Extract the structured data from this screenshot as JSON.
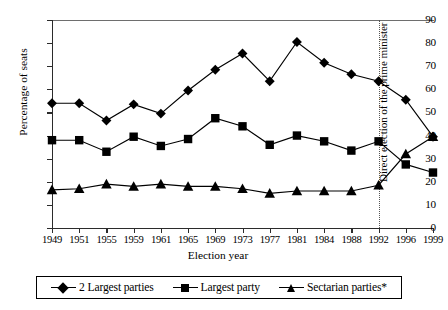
{
  "chart_data": {
    "type": "line",
    "title": "",
    "xlabel": "Election year",
    "ylabel": "Percentage of seats",
    "ylim": [
      0,
      90
    ],
    "yticks": [
      0,
      10,
      20,
      30,
      40,
      50,
      60,
      70,
      80,
      90
    ],
    "grid": false,
    "legend_position": "bottom",
    "categories": [
      "1949",
      "1951",
      "1955",
      "1959",
      "1961",
      "1965",
      "1969",
      "1973",
      "1977",
      "1981",
      "1984",
      "1988",
      "1992",
      "1996",
      "1999"
    ],
    "series": [
      {
        "name": "2 Largest parties",
        "marker": "diamond",
        "values": [
          54,
          54,
          46.5,
          53.5,
          49.5,
          59.5,
          68.5,
          75.5,
          63.5,
          80.5,
          71.5,
          66.5,
          63.5,
          55.5,
          39.5
        ]
      },
      {
        "name": "Largest party",
        "marker": "square",
        "values": [
          38,
          38,
          33,
          39.5,
          35.5,
          38.5,
          47.5,
          44,
          36,
          40,
          37.5,
          33.5,
          37.5,
          27.5,
          24
        ]
      },
      {
        "name": "Sectarian parties*",
        "marker": "triangle",
        "values": [
          16.5,
          17,
          19,
          18,
          19,
          18,
          18,
          17,
          15,
          16,
          16,
          16,
          18.5,
          32,
          39.5
        ]
      }
    ],
    "annotations": [
      {
        "text": "Direct election of the prime minister",
        "at_category": "1992",
        "orientation": "vertical",
        "line_style": "dotted"
      }
    ]
  },
  "axes": {
    "y_title": "Percentage of seats",
    "x_title": "Election year"
  },
  "colors": {
    "series_line": "#000000",
    "axis": "#2b2b2b",
    "annotation_line": "#555555",
    "background": "#ffffff"
  }
}
